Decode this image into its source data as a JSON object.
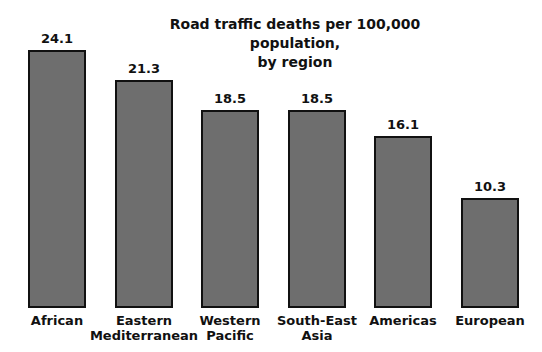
{
  "chart_data": {
    "type": "bar",
    "title": "Road traffic deaths per 100,000 population, by region",
    "title_lines": [
      "Road traffic deaths per 100,000 population,",
      "by region"
    ],
    "categories": [
      "African",
      "Eastern Mediterranean",
      "Western Pacific",
      "South-East Asia",
      "Americas",
      "European"
    ],
    "category_lines": [
      [
        "African"
      ],
      [
        "Eastern",
        "Mediterranean"
      ],
      [
        "Western",
        "Pacific"
      ],
      [
        "South-East",
        "Asia"
      ],
      [
        "Americas"
      ],
      [
        "European"
      ]
    ],
    "values": [
      24.1,
      21.3,
      18.5,
      18.5,
      16.1,
      10.3
    ],
    "value_labels": [
      "24.1",
      "21.3",
      "18.5",
      "18.5",
      "16.1",
      "10.3"
    ],
    "xlabel": "",
    "ylabel": "",
    "ylim": [
      0,
      24.1
    ],
    "grid": false,
    "legend": null,
    "colors": {
      "bar_fill": "#6e6e6e",
      "bar_border": "#111111"
    }
  }
}
